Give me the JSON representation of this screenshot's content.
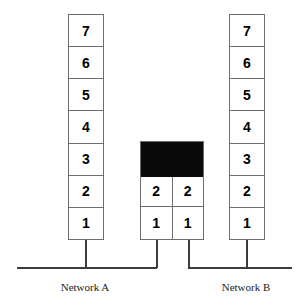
{
  "diagram": {
    "width": 308,
    "height": 306,
    "colors": {
      "background": "#ffffff",
      "cell_fill": "#ffffff",
      "cell_border": "#6e6e6e",
      "occupied_fill": "#0a0a0a",
      "wire": "#3c3c3c",
      "text": "#000000"
    }
  },
  "stacks": {
    "left": {
      "name": "Network A station buffer",
      "cells": [
        "7",
        "6",
        "5",
        "4",
        "3",
        "2",
        "1"
      ]
    },
    "middle": {
      "name": "Bridge dual-port buffer",
      "port_a": {
        "label": "bridge-port-a",
        "cells": [
          "2",
          "1"
        ]
      },
      "port_b": {
        "label": "bridge-port-b",
        "cells": [
          "2",
          "1"
        ]
      },
      "occupied_band": {
        "label": "unavailable-buffer-space",
        "filled": true
      }
    },
    "right": {
      "name": "Network B station buffer",
      "cells": [
        "7",
        "6",
        "5",
        "4",
        "3",
        "2",
        "1"
      ]
    }
  },
  "captions": {
    "network_a": "Network A",
    "network_b": "Network B"
  }
}
